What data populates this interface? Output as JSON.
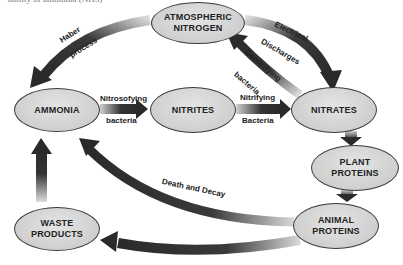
{
  "diagram": {
    "top_cut_text": "ability of ammonia (NH3)",
    "colors": {
      "background": "#ffffff",
      "node_fill": "#d0d0d0",
      "node_border": "#3a3a3a",
      "arrow_dark": "#2e2e2e",
      "arrow_light": "#cfcfcf",
      "text": "#222222"
    },
    "nodes": {
      "atmospheric_nitrogen": {
        "line1": "ATMOSPHERIC",
        "line2": "NITROGEN"
      },
      "ammonia": {
        "line1": "AMMONIA"
      },
      "nitrites": {
        "line1": "NITRITES"
      },
      "nitrates": {
        "line1": "NITRATES"
      },
      "plant_proteins": {
        "line1": "PLANT",
        "line2": "PROTEINS"
      },
      "animal_proteins": {
        "line1": "ANIMAL",
        "line2": "PROTEINS"
      },
      "waste_products": {
        "line1": "WASTE",
        "line2": "PRODUCTS"
      }
    },
    "edge_labels": {
      "haber_1": "Haber",
      "haber_2": "process",
      "electrical_1": "Electrical",
      "electrical_2": "Discharges",
      "denitrifying_1": "Denitrifying",
      "denitrifying_2": "bacteria",
      "nitrosofying_1": "Nitrosofying",
      "nitrosofying_2": "bacteria",
      "nitrifying_1": "Nitrifying",
      "nitrifying_2": "Bacteria",
      "death_decay": "Death and Decay"
    },
    "edges": [
      {
        "from": "ATMOSPHERIC NITROGEN",
        "to": "AMMONIA",
        "label": "Haber process"
      },
      {
        "from": "ATMOSPHERIC NITROGEN",
        "to": "NITRATES",
        "label": "Electrical Discharges"
      },
      {
        "from": "NITRATES",
        "to": "ATMOSPHERIC NITROGEN",
        "label": "Denitrifying bacteria"
      },
      {
        "from": "AMMONIA",
        "to": "NITRITES",
        "label": "Nitrosofying bacteria"
      },
      {
        "from": "NITRITES",
        "to": "NITRATES",
        "label": "Nitrifying Bacteria"
      },
      {
        "from": "NITRATES",
        "to": "PLANT PROTEINS",
        "label": ""
      },
      {
        "from": "PLANT PROTEINS",
        "to": "ANIMAL PROTEINS",
        "label": ""
      },
      {
        "from": "ANIMAL PROTEINS",
        "to": "AMMONIA",
        "label": "Death and Decay"
      },
      {
        "from": "ANIMAL PROTEINS",
        "to": "WASTE PRODUCTS",
        "label": ""
      },
      {
        "from": "WASTE PRODUCTS",
        "to": "AMMONIA",
        "label": ""
      }
    ]
  }
}
